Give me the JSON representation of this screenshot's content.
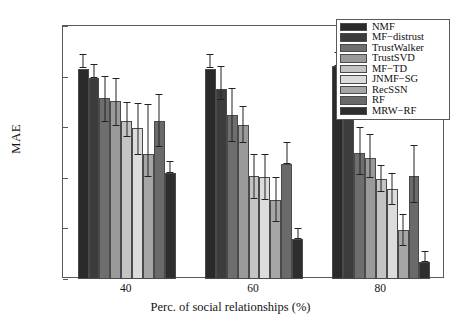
{
  "chart_data": {
    "type": "bar",
    "title": "",
    "xlabel": "Perc. of social relationships (%)",
    "ylabel": "MAE",
    "categories": [
      "40",
      "60",
      "80"
    ],
    "ylim": [
      0.9,
      1.15
    ],
    "yticks": [
      "0.9",
      "0.95",
      "1",
      "1.05",
      "1.1",
      "1.15"
    ],
    "ytick_values": [
      0.9,
      0.95,
      1.0,
      1.05,
      1.1,
      1.15
    ],
    "grid": false,
    "legend_position": "top-right",
    "error_bars": true,
    "series": [
      {
        "name": "NMF",
        "color": "#2a2a2a",
        "values": [
          1.108,
          1.108,
          1.11
        ],
        "err_low": [
          1.108,
          1.108,
          1.11
        ],
        "err_high": [
          1.122,
          1.122,
          1.124
        ]
      },
      {
        "name": "MF−distrust",
        "color": "#3c3c3c",
        "values": [
          1.099,
          1.088,
          1.081
        ],
        "err_low": [
          1.099,
          1.077,
          1.081
        ],
        "err_high": [
          1.112,
          1.11,
          1.094
        ]
      },
      {
        "name": "TrustWalker",
        "color": "#6e6e6e",
        "values": [
          1.079,
          1.062,
          1.025
        ],
        "err_low": [
          1.055,
          1.035,
          1.003
        ],
        "err_high": [
          1.101,
          1.089,
          1.05
        ]
      },
      {
        "name": "TrustSVD",
        "color": "#9a9a9a",
        "values": [
          1.076,
          1.052,
          1.02
        ],
        "err_low": [
          1.051,
          1.034,
          1.0
        ],
        "err_high": [
          1.099,
          1.071,
          1.043
        ]
      },
      {
        "name": "MF−TD",
        "color": "#c4c4c4",
        "values": [
          1.056,
          1.002,
          0.999
        ],
        "err_low": [
          1.04,
          0.979,
          0.986
        ],
        "err_high": [
          1.075,
          1.024,
          1.013
        ]
      },
      {
        "name": "JNMF−SG",
        "color": "#dcdcdc",
        "values": [
          1.049,
          1.001,
          0.989
        ],
        "err_low": [
          1.023,
          0.978,
          0.973
        ],
        "err_high": [
          1.074,
          1.024,
          1.005
        ]
      },
      {
        "name": "RecSSN",
        "color": "#a6a6a6",
        "values": [
          1.024,
          0.978,
          0.948
        ],
        "err_low": [
          1.001,
          0.956,
          0.933
        ],
        "err_high": [
          1.073,
          1.001,
          0.964
        ]
      },
      {
        "name": "RF",
        "color": "#6a6a6a",
        "values": [
          1.056,
          1.014,
          1.002
        ],
        "err_low": [
          1.03,
          1.014,
          0.975
        ],
        "err_high": [
          1.083,
          1.035,
          1.032
        ]
      },
      {
        "name": "MRW−RF",
        "color": "#2e2e2e",
        "values": [
          1.005,
          0.94,
          0.917
        ],
        "err_low": [
          1.005,
          0.94,
          0.917
        ],
        "err_high": [
          1.017,
          0.95,
          0.928
        ]
      }
    ]
  }
}
